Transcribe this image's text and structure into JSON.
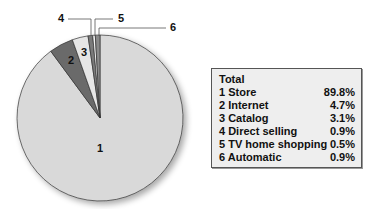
{
  "chart_data": {
    "type": "pie",
    "title": "",
    "legend_title": "Total",
    "categories": [
      "1 Store",
      "2 Internet",
      "3 Catalog",
      "4 Direct selling",
      "5 TV home shopping",
      "6 Automatic"
    ],
    "values": [
      89.8,
      4.7,
      3.1,
      0.9,
      0.5,
      0.9
    ],
    "value_labels": [
      "89.8%",
      "4.7%",
      "3.1%",
      "0.9%",
      "0.5%",
      "0.9%"
    ],
    "slice_labels": [
      "1",
      "2",
      "3",
      "4",
      "5",
      "6"
    ],
    "colors": [
      "#d9d9d9",
      "#6b6b6b",
      "#e6e6e6",
      "#7a7a7a",
      "#f2f2f2",
      "#8a8a8a"
    ],
    "legend_position": "right"
  },
  "legend": {
    "title": "Total",
    "rows": [
      {
        "label": "1 Store",
        "value": "89.8%"
      },
      {
        "label": "2 Internet",
        "value": "4.7%"
      },
      {
        "label": "3 Catalog",
        "value": "3.1%"
      },
      {
        "label": "4 Direct selling",
        "value": "0.9%"
      },
      {
        "label": "5 TV home shopping",
        "value": "0.5%"
      },
      {
        "label": "6 Automatic",
        "value": "0.9%"
      }
    ]
  },
  "callouts": {
    "c4": "4",
    "c5": "5",
    "c6": "6"
  }
}
